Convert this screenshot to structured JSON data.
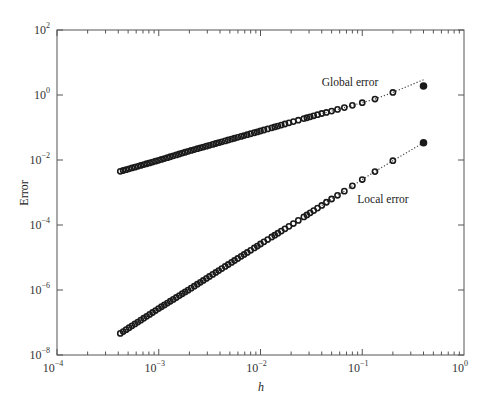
{
  "chart_data": {
    "type": "scatter",
    "title": "",
    "xlabel": "h",
    "ylabel": "Error",
    "xscale": "log",
    "yscale": "log",
    "xlim": [
      0.0001,
      1
    ],
    "ylim": [
      1e-08,
      100
    ],
    "grid": false,
    "legend": "none (inline annotations)",
    "x_ticks": [
      {
        "base": "10",
        "exp": "−4",
        "value": 0.0001
      },
      {
        "base": "10",
        "exp": "−3",
        "value": 0.001
      },
      {
        "base": "10",
        "exp": "−2",
        "value": 0.01
      },
      {
        "base": "10",
        "exp": "−1",
        "value": 0.1
      },
      {
        "base": "10",
        "exp": "0",
        "value": 1
      }
    ],
    "y_ticks": [
      {
        "base": "10",
        "exp": "−8",
        "value": 1e-08
      },
      {
        "base": "10",
        "exp": "−6",
        "value": 1e-06
      },
      {
        "base": "10",
        "exp": "−4",
        "value": 0.0001
      },
      {
        "base": "10",
        "exp": "−2",
        "value": 0.01
      },
      {
        "base": "10",
        "exp": "0",
        "value": 1
      },
      {
        "base": "10",
        "exp": "2",
        "value": 100
      }
    ],
    "x_rule": "h = 0.4 / n, n = 1 … 1000",
    "x": [
      0.4,
      0.2,
      0.1333,
      0.1,
      0.08,
      0.0667,
      0.0571,
      0.05,
      0.0444,
      0.04,
      0.02,
      0.01,
      0.004,
      0.002,
      0.001,
      0.0004
    ],
    "series": [
      {
        "name": "Global error",
        "marker": "circle",
        "values": [
          1.9,
          1.2,
          0.75,
          0.58,
          0.48,
          0.41,
          0.36,
          0.32,
          0.29,
          0.27,
          0.145,
          0.078,
          0.035,
          0.019,
          0.0098,
          0.0043
        ]
      },
      {
        "name": "Local error",
        "marker": "circle",
        "values": [
          0.034,
          0.0095,
          0.0044,
          0.0025,
          0.0016,
          0.0011,
          0.00082,
          0.00063,
          0.0005,
          0.0004,
          0.0001,
          2.6e-05,
          4.2e-06,
          1.05e-06,
          2.7e-07,
          4.2e-08
        ]
      }
    ],
    "annotations": [
      {
        "text": "Global error",
        "near_h": 0.12,
        "near_error": 3.2
      },
      {
        "text": "Local error",
        "near_h": 0.14,
        "near_error": 0.00055
      }
    ],
    "fit": {
      "global": {
        "slope": 0.88,
        "log_at_min_h": -2.37
      },
      "local": {
        "slope": 1.96,
        "log_at_min_h": -7.38
      },
      "min_log_h": -3.398
    }
  }
}
